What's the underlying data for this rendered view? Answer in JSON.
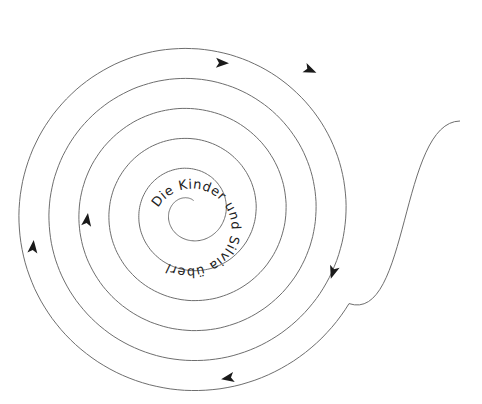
{
  "diagram": {
    "type": "spiral",
    "text": "Die Kinder und Silvia überlegen. Sie",
    "colors": {
      "line": "#6e6e6e",
      "arrow": "#1a1a1a",
      "text": "#222222",
      "background": "#ffffff"
    },
    "spiral": {
      "center": [
        190,
        212
      ],
      "spacing_px": 30,
      "turns": 6
    },
    "arrows": [
      {
        "name": "arrow-top-inner",
        "x": 222,
        "y": 63,
        "direction": "right"
      },
      {
        "name": "arrow-top-outer",
        "x": 310,
        "y": 70,
        "direction": "right-down"
      },
      {
        "name": "arrow-right",
        "x": 333,
        "y": 272,
        "direction": "down"
      },
      {
        "name": "arrow-bottom",
        "x": 228,
        "y": 378,
        "direction": "left"
      },
      {
        "name": "arrow-left-outer",
        "x": 33,
        "y": 247,
        "direction": "up"
      },
      {
        "name": "arrow-left-inner",
        "x": 87,
        "y": 220,
        "direction": "up"
      }
    ]
  }
}
